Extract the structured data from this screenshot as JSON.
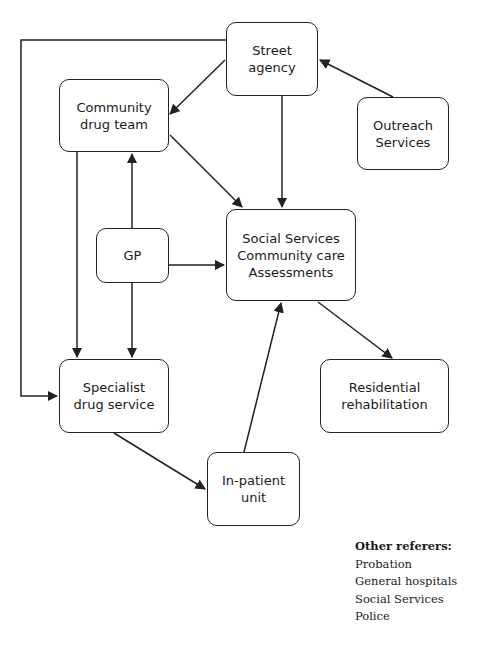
{
  "nodes": {
    "street_agency": {
      "lines": [
        "Street",
        "agency"
      ]
    },
    "community_drug_team": {
      "lines": [
        "Community",
        "drug team"
      ]
    },
    "outreach_services": {
      "lines": [
        "Outreach",
        "Services"
      ]
    },
    "gp": {
      "lines": [
        "GP"
      ]
    },
    "social_services": {
      "lines": [
        "Social Services",
        "Community care",
        "Assessments"
      ]
    },
    "specialist_drug_service": {
      "lines": [
        "Specialist",
        "drug service"
      ]
    },
    "residential_rehabilitation": {
      "lines": [
        "Residential",
        "rehabilitation"
      ]
    },
    "inpatient_unit": {
      "lines": [
        "In-patient",
        "unit"
      ]
    }
  },
  "edges": [
    {
      "from": "Outreach Services",
      "to": "Street agency"
    },
    {
      "from": "Street agency",
      "to": "Community drug team"
    },
    {
      "from": "Street agency",
      "to": "Social Services Community care Assessments"
    },
    {
      "from": "Street agency",
      "to": "Specialist drug service"
    },
    {
      "from": "Community drug team",
      "to": "Social Services Community care Assessments"
    },
    {
      "from": "Community drug team",
      "to": "Specialist drug service"
    },
    {
      "from": "GP",
      "to": "Community drug team"
    },
    {
      "from": "GP",
      "to": "Social Services Community care Assessments"
    },
    {
      "from": "GP",
      "to": "Specialist drug service"
    },
    {
      "from": "Social Services Community care Assessments",
      "to": "Residential rehabilitation"
    },
    {
      "from": "Specialist drug service",
      "to": "In-patient unit"
    },
    {
      "from": "In-patient unit",
      "to": "Social Services Community care Assessments"
    }
  ],
  "legend": {
    "title": "Other referers:",
    "items": [
      "Probation",
      "General hospitals",
      "Social Services",
      "Police"
    ]
  },
  "colors": {
    "stroke": "#222222",
    "text": "#1a1a1a",
    "background": "#ffffff"
  }
}
